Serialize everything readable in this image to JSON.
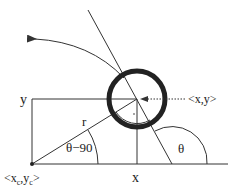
{
  "diagram": {
    "labels": {
      "y": "y",
      "x": "x",
      "r": "r",
      "theta": "θ",
      "theta_minus_90": "θ−90",
      "point": "<x,y>",
      "center_prefix": "<x",
      "center_sub_c1": "c",
      "center_mid": ",y",
      "center_sub_c2": "c",
      "center_suffix": ">"
    },
    "colors": {
      "line": "#333333",
      "circle": "#222222",
      "background": "#ffffff"
    }
  }
}
